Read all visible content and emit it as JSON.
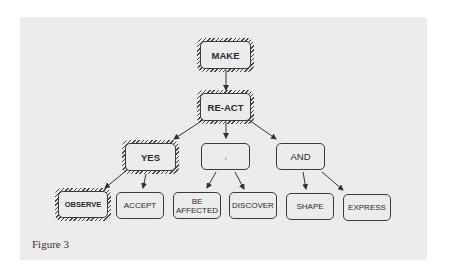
{
  "diagram": {
    "nodes": [
      {
        "id": "make",
        "label": "MAKE",
        "hatched": true
      },
      {
        "id": "react",
        "label": "RE-ACT",
        "hatched": true
      },
      {
        "id": "yes",
        "label": "YES",
        "hatched": true
      },
      {
        "id": "comma",
        "label": ",",
        "hatched": false
      },
      {
        "id": "and",
        "label": "AND",
        "hatched": false
      },
      {
        "id": "observe",
        "label": "OBSERVE",
        "hatched": true
      },
      {
        "id": "accept",
        "label": "ACCEPT",
        "hatched": false
      },
      {
        "id": "be_affected",
        "label": "BE AFFECTED",
        "line1": "BE",
        "line2": "AFFECTED",
        "hatched": false
      },
      {
        "id": "discover",
        "label": "DISCOVER",
        "hatched": false
      },
      {
        "id": "shape",
        "label": "SHAPE",
        "hatched": false
      },
      {
        "id": "express",
        "label": "EXPRESS",
        "hatched": false
      }
    ],
    "edges": [
      [
        "make",
        "react"
      ],
      [
        "react",
        "yes"
      ],
      [
        "react",
        "comma"
      ],
      [
        "react",
        "and"
      ],
      [
        "yes",
        "observe"
      ],
      [
        "yes",
        "accept"
      ],
      [
        "comma",
        "be_affected"
      ],
      [
        "comma",
        "discover"
      ],
      [
        "and",
        "shape"
      ],
      [
        "and",
        "express"
      ]
    ]
  },
  "caption": "Figure 3"
}
